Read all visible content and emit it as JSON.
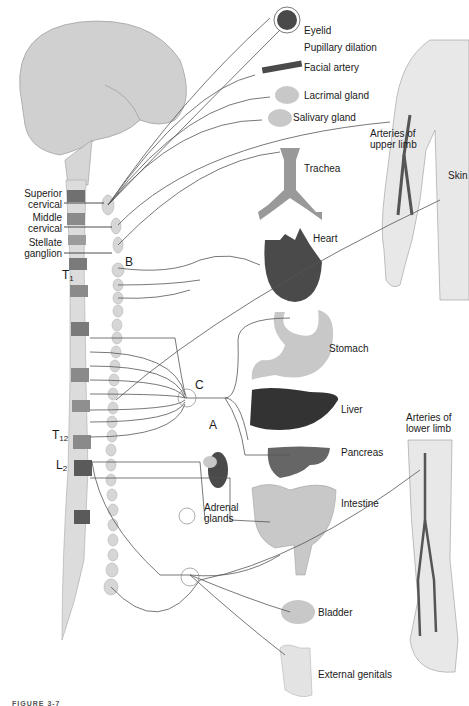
{
  "diagram": {
    "colors": {
      "nerve": "#555555",
      "organ_light": "#c8c8c8",
      "organ_dark": "#4a4a4a",
      "organ_mid": "#6e6e6e",
      "spinal_light": "#dcdcdc",
      "spinal_dark": "#707070",
      "limb": "#e6e6e6"
    },
    "ganglion_labels": {
      "superior": "Superior\ncervical",
      "superior_l1": "Superior",
      "superior_l2": "cervical",
      "middle_l1": "Middle",
      "middle_l2": "cervical",
      "stellate_l1": "Stellate",
      "stellate_l2": "ganglion"
    },
    "spinal_levels": {
      "t1_main": "T",
      "t1_sub": "1",
      "t12_main": "T",
      "t12_sub": "12",
      "l2_main": "L",
      "l2_sub": "2"
    },
    "markers": {
      "A": "A",
      "B": "B",
      "C": "C"
    },
    "targets": {
      "eyelid": "Eyelid",
      "pupil": "Pupillary dilation",
      "facial_artery": "Facial artery",
      "lacrimal": "Lacrimal gland",
      "salivary": "Salivary gland",
      "upper_limb_l1": "Arteries of",
      "upper_limb_l2": "upper limb",
      "skin": "Skin",
      "trachea": "Trachea",
      "heart": "Heart",
      "stomach": "Stomach",
      "liver": "Liver",
      "pancreas": "Pancreas",
      "lower_limb_l1": "Arteries of",
      "lower_limb_l2": "lower limb",
      "adrenal_l1": "Adrenal",
      "adrenal_l2": "glands",
      "intestine": "Intestine",
      "bladder": "Bladder",
      "genitals": "External genitals"
    },
    "caption": "FIGURE 3-7"
  }
}
